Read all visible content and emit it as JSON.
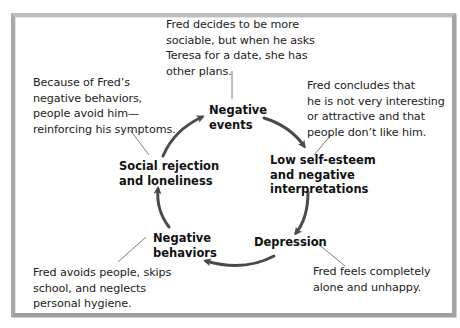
{
  "diagram": {
    "type": "cycle",
    "nodes": [
      {
        "id": "negative-events",
        "label": "Negative\nevents"
      },
      {
        "id": "low-self-esteem",
        "label": "Low self-esteem\nand negative\ninterpretations"
      },
      {
        "id": "depression",
        "label": "Depression"
      },
      {
        "id": "negative-behaviors",
        "label": "Negative\nbehaviors"
      },
      {
        "id": "social-rejection",
        "label": "Social rejection\nand loneliness"
      }
    ],
    "notes": [
      {
        "for": "negative-events",
        "text": "Fred decides to be more\nsociable, but when he asks\nTeresa for a date, she has\nother plans."
      },
      {
        "for": "low-self-esteem",
        "text": "Fred concludes that\nhe is not very interesting\nor attractive and that\npeople don’t like him."
      },
      {
        "for": "depression",
        "text": "Fred feels completely\nalone and unhappy."
      },
      {
        "for": "negative-behaviors",
        "text": "Fred avoids people, skips\nschool, and neglects\npersonal hygiene."
      },
      {
        "for": "social-rejection",
        "text": "Because of Fred’s\nnegative behaviors,\npeople avoid him—\nreinforcing his symptoms."
      }
    ],
    "edges": [
      [
        "negative-events",
        "low-self-esteem"
      ],
      [
        "low-self-esteem",
        "depression"
      ],
      [
        "depression",
        "negative-behaviors"
      ],
      [
        "negative-behaviors",
        "social-rejection"
      ],
      [
        "social-rejection",
        "negative-events"
      ]
    ],
    "colors": {
      "arrow": "#4a4a4a",
      "leader": "#6e6e6e",
      "frame": "#a8a8a8"
    }
  }
}
